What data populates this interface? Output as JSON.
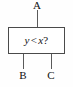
{
  "diagram": {
    "type": "comparator-block-diagram",
    "block": {
      "expression_full": "y < x?",
      "left_operand": "y",
      "operator": "<",
      "right_operand": "x",
      "question_mark": "?"
    },
    "terminals": {
      "top": {
        "label": "A",
        "position": "top",
        "role": "output"
      },
      "bottom_left": {
        "label": "B",
        "position": "bottom-left",
        "role": "input"
      },
      "bottom_right": {
        "label": "C",
        "position": "bottom-right",
        "role": "input"
      }
    },
    "colors": {
      "background": "#fefefe",
      "box_border": "#4a4a4a",
      "box_fill": "#ffffff",
      "wire": "#5a5a5a",
      "text": "#111111"
    }
  }
}
